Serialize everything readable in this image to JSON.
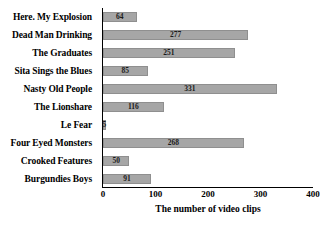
{
  "chart_data": {
    "type": "bar",
    "orientation": "horizontal",
    "title": "",
    "xlabel": "The number of video clips",
    "ylabel": "",
    "xlim": [
      0,
      400
    ],
    "xticks": [
      0,
      100,
      200,
      300,
      400
    ],
    "grid": false,
    "legend": null,
    "bar_color": "#a6a6a6",
    "categories": [
      "Here. My Explosion",
      "Dead Man Drinking",
      "The Graduates",
      "Sita Sings the Blues",
      "Nasty Old People",
      "The Lionshare",
      "Le Fear",
      "Four Eyed Monsters",
      "Crooked Features",
      "Burgundies Boys"
    ],
    "values": [
      64,
      277,
      251,
      85,
      331,
      116,
      5,
      268,
      50,
      91
    ]
  }
}
